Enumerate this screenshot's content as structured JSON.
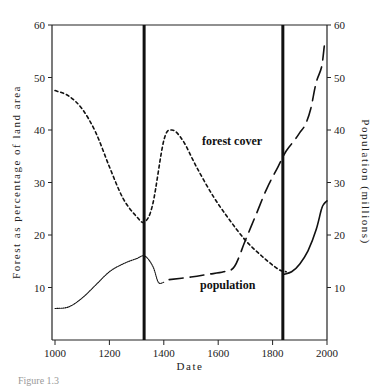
{
  "chart_data": {
    "type": "line",
    "title": "",
    "caption": "Figure 1.3",
    "xlabel": "Date",
    "ylabel_left": "Forest as percentage of land area",
    "ylabel_right": "Population (millions)",
    "xlim": [
      1000,
      2000
    ],
    "ylim_left": [
      0,
      60
    ],
    "ylim_right": [
      0,
      60
    ],
    "x_ticks": [
      "1000",
      "1200",
      "1400",
      "1600",
      "1800",
      "2000"
    ],
    "y_ticks_left": [
      "10",
      "20",
      "30",
      "40",
      "50",
      "60"
    ],
    "y_ticks_right": [
      "10",
      "20",
      "30",
      "40",
      "50",
      "60"
    ],
    "grid": false,
    "vertical_markers": [
      1335,
      1845
    ],
    "annotations": [
      {
        "text": "forest cover",
        "x": 1560,
        "y": 38
      },
      {
        "text": "population",
        "x": 1560,
        "y": 13
      }
    ],
    "series": [
      {
        "name": "forest cover",
        "axis": "left",
        "style": "short-dash",
        "x": [
          1000,
          1050,
          1100,
          1150,
          1200,
          1250,
          1300,
          1330,
          1360,
          1400,
          1430,
          1470,
          1520,
          1580,
          1640,
          1700,
          1760,
          1820,
          1850
        ],
        "y": [
          47.5,
          46.5,
          44,
          39.5,
          33,
          27,
          23.5,
          22.5,
          26,
          38,
          40,
          38,
          33,
          27.5,
          23,
          19,
          16,
          13.5,
          13
        ]
      },
      {
        "name": "population (dotted, early)",
        "axis": "right",
        "style": "dotted",
        "x": [
          1000,
          1050,
          1100,
          1150,
          1200,
          1250,
          1300,
          1330,
          1360,
          1380,
          1400
        ],
        "y": [
          6,
          6.3,
          8,
          10.5,
          13,
          14.5,
          15.5,
          16,
          14,
          11,
          11
        ]
      },
      {
        "name": "population (long-dash)",
        "axis": "right",
        "style": "long-dash",
        "x": [
          1420,
          1500,
          1560,
          1620,
          1660,
          1700,
          1740,
          1780,
          1820,
          1850,
          1880,
          1900,
          1920,
          1940,
          1960,
          1980,
          1990
        ],
        "y": [
          11.5,
          12,
          12.5,
          13,
          14,
          19,
          24,
          29,
          33,
          36,
          38,
          39.5,
          41,
          44,
          49,
          52,
          56
        ]
      },
      {
        "name": "population (solid, modern)",
        "axis": "right",
        "style": "solid",
        "x": [
          1840,
          1870,
          1900,
          1930,
          1960,
          1980,
          1990,
          2000
        ],
        "y": [
          12.5,
          13,
          14.5,
          17,
          21,
          25,
          26,
          26.5
        ]
      }
    ]
  }
}
